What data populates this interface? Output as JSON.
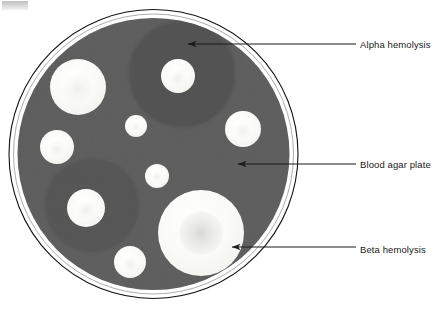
{
  "figure": {
    "background_color": "#ffffff",
    "dish": {
      "name": "petri-dish",
      "agar_color": "#5a5a5a",
      "rim_color": "#000000",
      "rim_gap_color": "#ffffff",
      "center_x": 153.5,
      "center_y": 154,
      "radius_outer": 145,
      "radius_agar": 136
    },
    "colors": {
      "agar": "#5a5a5a",
      "colony": "#f7f7f5",
      "colony_core": "#ebebe8",
      "alpha_zone": "#525252",
      "beta_core": "#d8d8d5",
      "label_text": "#1a1a1a",
      "leader_line": "#1a1a1a"
    },
    "colonies": [
      {
        "name": "colony-upper-left-large",
        "cx": 78,
        "cy": 87,
        "r": 28,
        "core_r": 14
      },
      {
        "name": "colony-top-center",
        "cx": 178,
        "cy": 76,
        "r": 17,
        "core_r": 8
      },
      {
        "name": "colony-center-small",
        "cx": 136,
        "cy": 126,
        "r": 11,
        "core_r": 5
      },
      {
        "name": "colony-left-mid",
        "cx": 57,
        "cy": 147,
        "r": 17,
        "core_r": 8
      },
      {
        "name": "colony-right-mid",
        "cx": 243,
        "cy": 129,
        "r": 18,
        "core_r": 8
      },
      {
        "name": "colony-center-low",
        "cx": 157,
        "cy": 176,
        "r": 12,
        "core_r": 5
      },
      {
        "name": "colony-lower-left",
        "cx": 86,
        "cy": 208,
        "r": 19,
        "core_r": 9
      },
      {
        "name": "colony-bottom-left",
        "cx": 130,
        "cy": 262,
        "r": 16,
        "core_r": 7
      },
      {
        "name": "colony-beta-large",
        "cx": 201,
        "cy": 233,
        "r": 43,
        "core_r": 20
      }
    ],
    "hemolysis_zones": [
      {
        "name": "alpha-zone-top",
        "cx": 182,
        "cy": 74,
        "r": 52
      },
      {
        "name": "alpha-zone-lower-left",
        "cx": 92,
        "cy": 205,
        "r": 46
      }
    ],
    "annotations": [
      {
        "id": "alpha",
        "name": "annotation-alpha-hemolysis",
        "label": "Alpha hemolysis",
        "arrow_tip_x": 186,
        "arrow_tip_y": 44,
        "line_end_x": 356,
        "line_end_y": 44
      },
      {
        "id": "agar",
        "name": "annotation-blood-agar-plate",
        "label": "Blood agar plate",
        "arrow_tip_x": 236,
        "arrow_tip_y": 164,
        "line_end_x": 356,
        "line_end_y": 164
      },
      {
        "id": "beta",
        "name": "annotation-beta-hemolysis",
        "label": "Beta hemolysis",
        "arrow_tip_x": 230,
        "arrow_tip_y": 247,
        "line_end_x": 356,
        "line_end_y": 247
      }
    ]
  }
}
